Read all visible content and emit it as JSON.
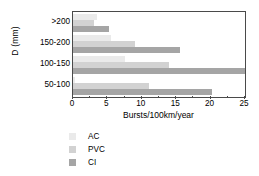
{
  "chart_data": {
    "type": "bar",
    "orientation": "horizontal",
    "title": "",
    "xlabel": "Bursts/100km/year",
    "ylabel": "D (mm)",
    "categories": [
      ">200",
      "150-200",
      "100-150",
      "50-100"
    ],
    "series": [
      {
        "name": "AC",
        "color": "#eaeaea",
        "values": [
          3.5,
          5.5,
          7.5,
          0.3
        ]
      },
      {
        "name": "PVC",
        "color": "#d2d2d2",
        "values": [
          3.0,
          9.0,
          14.0,
          11.0
        ]
      },
      {
        "name": "CI",
        "color": "#a5a5a5",
        "values": [
          5.2,
          15.5,
          25.0,
          20.2
        ]
      }
    ],
    "xlim": [
      0,
      25
    ],
    "xticks": [
      0,
      5,
      10,
      15,
      20,
      25
    ],
    "xtick_labels": [
      "0",
      "5",
      "10",
      "15",
      "20",
      "25"
    ],
    "grid": false,
    "legend_position": "below-left",
    "legend_entries": [
      "AC",
      "PVC",
      "CI"
    ]
  }
}
